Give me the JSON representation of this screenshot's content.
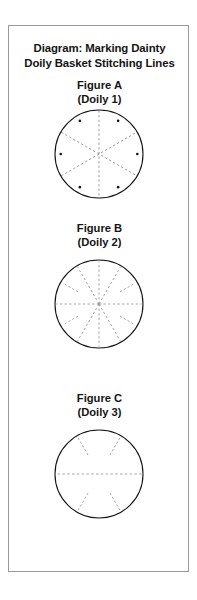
{
  "document": {
    "title_line_1": "Diagram: Marking Dainty",
    "title_line_2": "Doily Basket Stitching Lines",
    "border_color": "#9a9a9a",
    "background_color": "#ffffff",
    "ink_color": "#141414",
    "guide_line_color": "#8d8d8d"
  },
  "figures": [
    {
      "id": "figure-a",
      "label": "Figure A",
      "sublabel": "(Doily 1)",
      "shape": "circle",
      "circle": {
        "cx": 90,
        "cy": 48,
        "r": 44
      },
      "guide_lines": 3,
      "guide_line_type": "full-diameter-dashed",
      "spoke_count": 6,
      "spoke_angles_deg": [
        90,
        150,
        210,
        270,
        330,
        30
      ],
      "marker_dots": 6,
      "marker_dot_angles_deg": [
        60,
        120,
        180,
        240,
        300,
        0
      ],
      "marker_dot_radius_px": 1.3
    },
    {
      "id": "figure-b",
      "label": "Figure B",
      "sublabel": "(Doily 2)",
      "shape": "circle",
      "circle": {
        "cx": 90,
        "cy": 55,
        "r": 44
      },
      "guide_lines": 6,
      "guide_line_type": "mixed-full-and-partial-dashed",
      "spoke_count": 12,
      "spoke_angles_deg": [
        0,
        30,
        60,
        90,
        120,
        150,
        180,
        210,
        240,
        270,
        300,
        330
      ],
      "full_spoke_angles_deg": [
        0,
        60,
        90,
        120,
        180,
        240,
        270,
        300
      ],
      "partial_spoke_angles_deg": [
        30,
        150,
        210,
        330
      ],
      "partial_spoke_inner_fraction": 0.55,
      "marker_dots": 0
    },
    {
      "id": "figure-c",
      "label": "Figure C",
      "sublabel": "(Doily 3)",
      "shape": "circle",
      "circle": {
        "cx": 90,
        "cy": 55,
        "r": 44
      },
      "guide_lines": 1,
      "guide_line_type": "horizontal-diameter-plus-rim-ticks",
      "spoke_count": 2,
      "spoke_angles_deg": [
        0,
        180
      ],
      "rim_tick_count": 4,
      "rim_tick_angles_deg": [
        60,
        120,
        240,
        300
      ],
      "rim_tick_inner_fraction": 0.5,
      "marker_dots": 0
    }
  ]
}
